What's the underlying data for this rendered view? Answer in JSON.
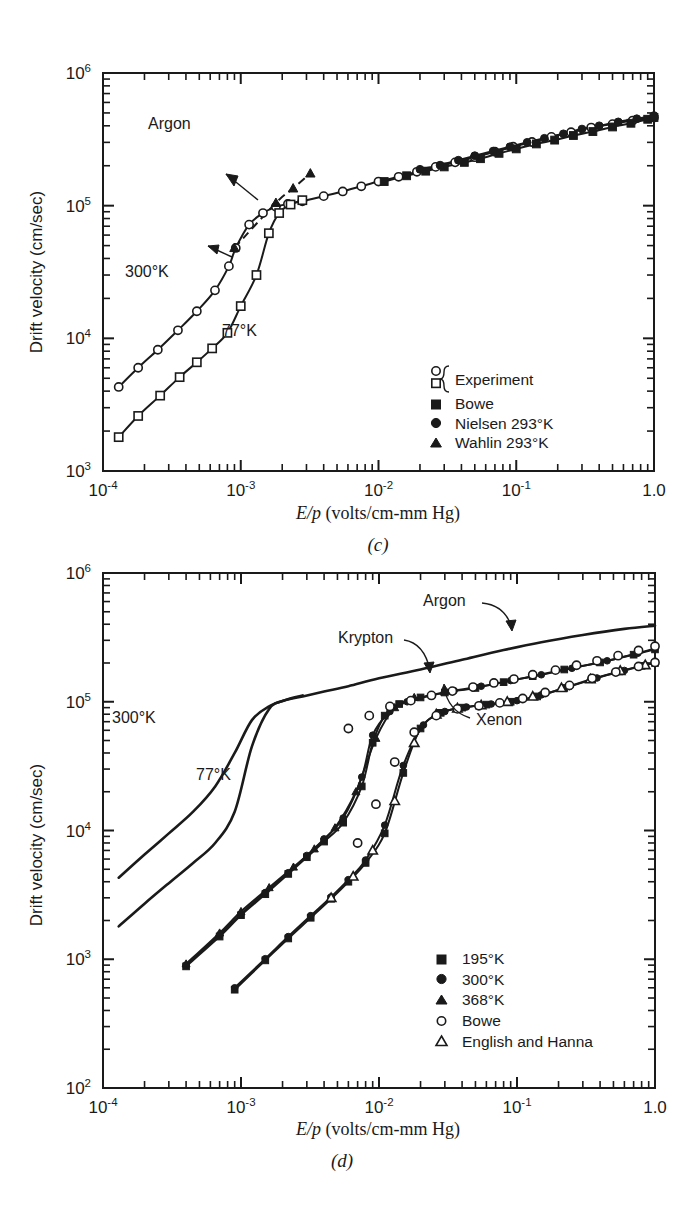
{
  "figure": {
    "panels": [
      {
        "id": "c",
        "subfigure_label": "(c)",
        "gas_label": "Argon",
        "axes": {
          "x": {
            "label_html": "E/p (volts/cm-mm Hg)",
            "label_italic": "E/p",
            "label_rest": " (volts/cm-mm Hg)",
            "ticks": [
              "10",
              "10",
              "10",
              "10",
              "1.0"
            ],
            "exponents": [
              "-4",
              "-3",
              "-2",
              "-1",
              ""
            ],
            "min": 0.0001,
            "max": 1.0,
            "scale": "log"
          },
          "y": {
            "label": "Drift velocity (cm/sec)",
            "ticks": [
              "10",
              "10",
              "10",
              "10"
            ],
            "exponents": [
              "3",
              "4",
              "5",
              "6"
            ],
            "min": 1000,
            "max": 1000000,
            "scale": "log"
          }
        },
        "curve_labels": [
          {
            "text": "300°K"
          },
          {
            "text": "77°K"
          }
        ],
        "legend": [
          {
            "marker": "open-circle-open-square-brace",
            "label": "Experiment"
          },
          {
            "marker": "filled-square",
            "label": "Bowe"
          },
          {
            "marker": "filled-circle",
            "label": "Nielsen 293°K"
          },
          {
            "marker": "filled-triangle",
            "label": "Wahlin 293°K"
          }
        ]
      },
      {
        "id": "d",
        "subfigure_label": "(d)",
        "axes": {
          "x": {
            "label_italic": "E/p",
            "label_rest": " (volts/cm-mm Hg)",
            "ticks": [
              "10",
              "10",
              "10",
              "10",
              "1.0"
            ],
            "exponents": [
              "-4",
              "-3",
              "-2",
              "-1",
              ""
            ],
            "min": 0.0001,
            "max": 1.0,
            "scale": "log"
          },
          "y": {
            "label": "Drift velocity (cm/sec)",
            "ticks": [
              "10",
              "10",
              "10",
              "10",
              "10"
            ],
            "exponents": [
              "2",
              "3",
              "4",
              "5",
              "6"
            ],
            "min": 100,
            "max": 1000000,
            "scale": "log"
          }
        },
        "curve_labels": [
          {
            "text": "Argon"
          },
          {
            "text": "Krypton"
          },
          {
            "text": "Xenon"
          },
          {
            "text": "300°K"
          },
          {
            "text": "77°K"
          }
        ],
        "legend": [
          {
            "marker": "filled-square",
            "label": "195°K"
          },
          {
            "marker": "filled-circle",
            "label": "300°K"
          },
          {
            "marker": "filled-triangle",
            "label": "368°K"
          },
          {
            "marker": "open-circle",
            "label": "Bowe"
          },
          {
            "marker": "open-triangle",
            "label": "English and Hanna"
          }
        ]
      }
    ]
  },
  "chart_data": [
    {
      "type": "line",
      "panel": "(c)",
      "title": "Argon",
      "xlabel": "E/p (volts/cm-mm Hg)",
      "ylabel": "Drift velocity (cm/sec)",
      "xscale": "log",
      "yscale": "log",
      "xlim": [
        0.0001,
        1.0
      ],
      "ylim": [
        1000,
        1000000
      ],
      "grid": false,
      "legend_position": "lower-right-inside",
      "series": [
        {
          "name": "Argon 300°K (Experiment, open circles)",
          "marker": "open-circle",
          "x": [
            0.00013,
            0.00018,
            0.00025,
            0.00035,
            0.00048,
            0.00065,
            0.00082,
            0.00092,
            0.00115,
            0.00145,
            0.0018,
            0.0022,
            0.0028,
            0.004,
            0.0055,
            0.0075,
            0.01,
            0.014,
            0.019,
            0.026,
            0.036,
            0.05,
            0.07,
            0.095,
            0.13,
            0.18,
            0.25,
            0.35,
            0.5,
            0.7,
            1.0
          ],
          "y": [
            4300,
            6000,
            8200,
            11500,
            16000,
            23000,
            35000,
            48000,
            72000,
            88000,
            98000,
            103000,
            108000,
            118000,
            128000,
            140000,
            152000,
            165000,
            180000,
            196000,
            212000,
            232000,
            255000,
            278000,
            302000,
            330000,
            358000,
            388000,
            412000,
            438000,
            462000
          ]
        },
        {
          "name": "Argon 77°K (Experiment, open squares)",
          "marker": "open-square",
          "x": [
            0.00013,
            0.00018,
            0.00026,
            0.00036,
            0.00048,
            0.00062,
            0.0008,
            0.001,
            0.0013,
            0.0016,
            0.0019,
            0.0023,
            0.0028
          ],
          "y": [
            1800,
            2600,
            3700,
            5100,
            6600,
            8400,
            11000,
            17500,
            30000,
            62000,
            88000,
            102000,
            110000
          ]
        },
        {
          "name": "Bowe (filled squares)",
          "marker": "filled-square",
          "x": [
            0.011,
            0.016,
            0.022,
            0.03,
            0.042,
            0.055,
            0.075,
            0.1,
            0.14,
            0.19,
            0.26,
            0.36,
            0.5,
            0.68,
            0.9,
            1.0
          ],
          "y": [
            152000,
            168000,
            182000,
            196000,
            212000,
            226000,
            248000,
            268000,
            292000,
            312000,
            338000,
            362000,
            392000,
            418000,
            448000,
            462000
          ]
        },
        {
          "name": "Nielsen 293°K (filled circles)",
          "marker": "filled-circle",
          "x": [
            0.02,
            0.028,
            0.038,
            0.05,
            0.068,
            0.09,
            0.12,
            0.16,
            0.22,
            0.3,
            0.4,
            0.55,
            0.75,
            1.0
          ],
          "y": [
            188000,
            202000,
            220000,
            238000,
            258000,
            278000,
            300000,
            322000,
            348000,
            378000,
            400000,
            428000,
            452000,
            478000
          ]
        },
        {
          "name": "Wahlin 293°K (filled triangles, dashed)",
          "marker": "filled-triangle",
          "x": [
            0.0009,
            0.0018,
            0.0024,
            0.0032
          ],
          "y": [
            48000,
            105000,
            135000,
            175000
          ]
        }
      ]
    },
    {
      "type": "line",
      "panel": "(d)",
      "title": "",
      "xlabel": "E/p (volts/cm-mm Hg)",
      "ylabel": "Drift velocity (cm/sec)",
      "xscale": "log",
      "yscale": "log",
      "xlim": [
        0.0001,
        1.0
      ],
      "ylim": [
        100,
        1000000
      ],
      "grid": false,
      "legend_position": "lower-right-inside",
      "series": [
        {
          "name": "Argon 300°K (solid curve)",
          "marker": "none",
          "x": [
            0.00013,
            0.0002,
            0.0003,
            0.00045,
            0.00065,
            0.0009,
            0.0012,
            0.0016,
            0.0021,
            0.0028,
            0.004,
            0.006,
            0.01,
            0.02,
            0.04,
            0.08,
            0.15,
            0.3,
            0.6,
            1.0
          ],
          "y": [
            4300,
            6500,
            9500,
            14000,
            22000,
            40000,
            72000,
            92000,
            103000,
            110000,
            120000,
            132000,
            152000,
            178000,
            212000,
            252000,
            290000,
            330000,
            368000,
            390000
          ]
        },
        {
          "name": "Argon 77°K (solid curve)",
          "marker": "none",
          "x": [
            0.00013,
            0.0002,
            0.0003,
            0.00045,
            0.00065,
            0.0009,
            0.0012,
            0.0016,
            0.0021,
            0.0028
          ],
          "y": [
            1800,
            2700,
            3900,
            5600,
            8000,
            14000,
            45000,
            88000,
            103000,
            112000
          ]
        },
        {
          "name": "Krypton 195°K (filled squares)",
          "marker": "filled-square",
          "x": [
            0.0004,
            0.0007,
            0.001,
            0.0015,
            0.0022,
            0.003,
            0.004,
            0.0055,
            0.0075,
            0.009,
            0.011,
            0.014,
            0.02,
            0.03,
            0.05,
            0.08,
            0.13,
            0.22,
            0.4,
            0.7,
            1.0
          ],
          "y": [
            880,
            1500,
            2200,
            3200,
            4600,
            6200,
            8200,
            11500,
            22000,
            48000,
            78000,
            96000,
            108000,
            118000,
            128000,
            142000,
            158000,
            178000,
            202000,
            232000,
            255000
          ]
        },
        {
          "name": "Krypton 300°K (filled circles)",
          "marker": "filled-circle",
          "x": [
            0.0004,
            0.0007,
            0.001,
            0.0015,
            0.0022,
            0.003,
            0.004,
            0.0055,
            0.0075,
            0.009,
            0.012,
            0.016,
            0.024,
            0.035,
            0.055,
            0.09,
            0.15,
            0.25,
            0.45,
            0.75,
            1.0
          ],
          "y": [
            900,
            1550,
            2250,
            3300,
            4700,
            6400,
            8600,
            12500,
            26000,
            55000,
            84000,
            100000,
            112000,
            122000,
            132000,
            146000,
            162000,
            182000,
            208000,
            238000,
            260000
          ]
        },
        {
          "name": "Krypton 368°K (filled triangles)",
          "marker": "filled-triangle",
          "x": [
            0.0004,
            0.0007,
            0.001,
            0.0016,
            0.0024,
            0.0034,
            0.0048,
            0.0068,
            0.0095,
            0.013,
            0.018
          ],
          "y": [
            920,
            1600,
            2350,
            3600,
            5200,
            7200,
            10500,
            20000,
            52000,
            90000,
            108000
          ]
        },
        {
          "name": "Krypton Bowe (open circles)",
          "marker": "open-circle",
          "x": [
            0.006,
            0.0085,
            0.012,
            0.017,
            0.024,
            0.034,
            0.048,
            0.068,
            0.095,
            0.13,
            0.19,
            0.27,
            0.38,
            0.54,
            0.76,
            1.0
          ],
          "y": [
            62000,
            78000,
            92000,
            102000,
            112000,
            121000,
            130000,
            140000,
            150000,
            162000,
            176000,
            192000,
            208000,
            228000,
            250000,
            270000
          ]
        },
        {
          "name": "Xenon 195°K (filled squares)",
          "marker": "filled-square",
          "x": [
            0.0009,
            0.0015,
            0.0022,
            0.0032,
            0.0045,
            0.006,
            0.008,
            0.011,
            0.015,
            0.02,
            0.028,
            0.04,
            0.06,
            0.09,
            0.14,
            0.22,
            0.35,
            0.55,
            0.8,
            1.0
          ],
          "y": [
            580,
            980,
            1450,
            2100,
            2950,
            4000,
            5600,
            9500,
            28000,
            62000,
            82000,
            90000,
            95000,
            100000,
            110000,
            128000,
            150000,
            172000,
            190000,
            200000
          ]
        },
        {
          "name": "Xenon 300°K (filled circles)",
          "marker": "filled-circle",
          "x": [
            0.0009,
            0.0015,
            0.0022,
            0.0032,
            0.0045,
            0.006,
            0.008,
            0.011,
            0.015,
            0.021,
            0.03,
            0.043,
            0.065,
            0.1,
            0.15,
            0.24,
            0.38,
            0.6,
            0.85,
            1.0
          ],
          "y": [
            600,
            1010,
            1500,
            2180,
            3050,
            4150,
            5900,
            11000,
            32000,
            66000,
            84000,
            91000,
            96000,
            102000,
            113000,
            131000,
            153000,
            175000,
            193000,
            202000
          ]
        },
        {
          "name": "Xenon English and Hanna (open triangles)",
          "marker": "open-triangle",
          "x": [
            0.0045,
            0.0065,
            0.009,
            0.013,
            0.018,
            0.026,
            0.037,
            0.055,
            0.085,
            0.13,
            0.21,
            0.34,
            0.56,
            0.85
          ],
          "y": [
            3000,
            4400,
            7000,
            17000,
            48000,
            80000,
            89000,
            94000,
            100000,
            110000,
            128000,
            150000,
            174000,
            193000
          ]
        },
        {
          "name": "Xenon Bowe (open circles)",
          "marker": "open-circle",
          "x": [
            0.007,
            0.0095,
            0.013,
            0.018,
            0.026,
            0.037,
            0.053,
            0.075,
            0.11,
            0.16,
            0.24,
            0.35,
            0.52,
            0.76,
            1.0
          ],
          "y": [
            8000,
            16000,
            34000,
            58000,
            78000,
            88000,
            93000,
            98000,
            106000,
            118000,
            134000,
            152000,
            170000,
            188000,
            202000
          ]
        }
      ]
    }
  ]
}
